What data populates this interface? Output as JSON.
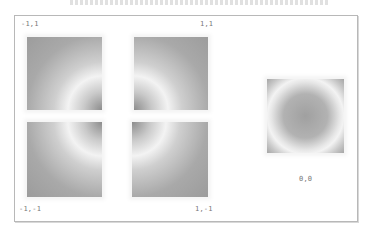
{
  "header": {
    "title_fragment": ""
  },
  "panels": [
    {
      "name": "top-left",
      "corner": "bottom-right",
      "label": "-1,1"
    },
    {
      "name": "top-right",
      "corner": "bottom-left",
      "label": "1,1"
    },
    {
      "name": "bottom-left",
      "corner": "top-right",
      "label": "-1,-1"
    },
    {
      "name": "bottom-right",
      "corner": "top-left",
      "label": "1,-1"
    },
    {
      "name": "center",
      "corner": "center",
      "label": "0,0"
    }
  ],
  "colors": {
    "gray_dark": "#8a8a8a",
    "gray_mid": "#a8a8a8",
    "ring": "#f2f2f2",
    "border": "#b8b8b8"
  }
}
